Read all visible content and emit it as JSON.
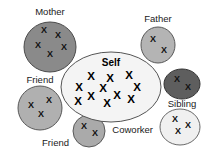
{
  "diagram": {
    "background_color": "#ffffff",
    "center": {
      "id": "self",
      "label": "Self",
      "shape": "ellipse",
      "fill_color": "#f4f4f4",
      "stroke_color": "#555555",
      "cx": 111,
      "cy": 87,
      "rx": 50,
      "ry": 35,
      "label_x": 111,
      "label_y": 66,
      "mark_glyph": "X",
      "mark_count": 11,
      "marks": [
        {
          "x": 91,
          "y": 80
        },
        {
          "x": 110,
          "y": 82
        },
        {
          "x": 129,
          "y": 79
        },
        {
          "x": 79,
          "y": 91
        },
        {
          "x": 103,
          "y": 92
        },
        {
          "x": 137,
          "y": 91
        },
        {
          "x": 91,
          "y": 100
        },
        {
          "x": 117,
          "y": 99
        },
        {
          "x": 131,
          "y": 103
        },
        {
          "x": 78,
          "y": 105
        },
        {
          "x": 107,
          "y": 107
        }
      ]
    },
    "groups": [
      {
        "id": "mother",
        "label": "Mother",
        "shape": "circle",
        "fill_color": "#8a8a8a",
        "stroke_color": "#4a4a4a",
        "cx": 50,
        "cy": 47,
        "rx": 26,
        "ry": 25,
        "label_x": 50,
        "label_y": 15,
        "label_anchor": "middle",
        "mark_glyph": "X",
        "mark_count": 5,
        "marks": [
          {
            "x": 44,
            "y": 33
          },
          {
            "x": 58,
            "y": 38
          },
          {
            "x": 38,
            "y": 48
          },
          {
            "x": 64,
            "y": 50
          },
          {
            "x": 50,
            "y": 57
          }
        ]
      },
      {
        "id": "father",
        "label": "Father",
        "shape": "circle",
        "fill_color": "#b4b4b4",
        "stroke_color": "#595959",
        "cx": 158,
        "cy": 45,
        "rx": 17,
        "ry": 18,
        "label_x": 158,
        "label_y": 22,
        "label_anchor": "middle",
        "mark_glyph": "X",
        "mark_count": 2,
        "marks": [
          {
            "x": 153,
            "y": 42
          },
          {
            "x": 164,
            "y": 53
          }
        ]
      },
      {
        "id": "sibling",
        "label": "Sibling",
        "shape": "ellipse",
        "fill_color": "#5e5e5e",
        "stroke_color": "#333333",
        "cx": 182,
        "cy": 84,
        "rx": 18,
        "ry": 15,
        "label_x": 182,
        "label_y": 107,
        "label_anchor": "middle",
        "mark_glyph": "X",
        "mark_count": 2,
        "marks": [
          {
            "x": 177,
            "y": 82
          },
          {
            "x": 188,
            "y": 90
          }
        ]
      },
      {
        "id": "coworker",
        "label": "Coworker",
        "shape": "ellipse",
        "fill_color": "#f0f0f0",
        "stroke_color": "#6a6a6a",
        "cx": 180,
        "cy": 127,
        "rx": 20,
        "ry": 18,
        "label_x": 153,
        "label_y": 133,
        "label_anchor": "end",
        "mark_glyph": "X",
        "mark_count": 3,
        "marks": [
          {
            "x": 175,
            "y": 122
          },
          {
            "x": 188,
            "y": 128
          },
          {
            "x": 178,
            "y": 134
          }
        ]
      },
      {
        "id": "friend-left",
        "label": "Friend",
        "shape": "circle",
        "fill_color": "#b0b0b0",
        "stroke_color": "#595959",
        "cx": 40,
        "cy": 108,
        "rx": 22,
        "ry": 22,
        "label_x": 40,
        "label_y": 83,
        "label_anchor": "middle",
        "mark_glyph": "X",
        "mark_count": 3,
        "marks": [
          {
            "x": 31,
            "y": 108
          },
          {
            "x": 49,
            "y": 103
          },
          {
            "x": 41,
            "y": 117
          }
        ]
      },
      {
        "id": "friend-bottom",
        "label": "Friend",
        "shape": "circle",
        "fill_color": "#aaaaaa",
        "stroke_color": "#595959",
        "cx": 89,
        "cy": 131,
        "rx": 16,
        "ry": 16,
        "label_x": 69,
        "label_y": 146,
        "label_anchor": "end",
        "mark_glyph": "X",
        "mark_count": 2,
        "marks": [
          {
            "x": 84,
            "y": 129
          },
          {
            "x": 95,
            "y": 136
          }
        ]
      }
    ]
  }
}
